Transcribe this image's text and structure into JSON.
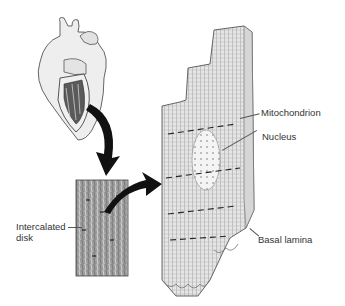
{
  "diagram": {
    "colors": {
      "background": "#ffffff",
      "ink": "#222222",
      "shade_light": "#d8d8d8",
      "shade_mid": "#a8a8a8",
      "shade_dark": "#555555",
      "label_text": "#333333"
    },
    "nodes": [
      {
        "id": "heart",
        "desc": "Heart illustration with cut-away ventricle wall"
      },
      {
        "id": "tissue-section",
        "desc": "Rectangular histology section of cardiac muscle"
      },
      {
        "id": "fiber-block",
        "desc": "3D block of cardiac muscle fibers with nucleus"
      }
    ],
    "arrows": [
      {
        "from": "heart",
        "to": "tissue-section"
      },
      {
        "from": "tissue-section",
        "to": "fiber-block"
      }
    ],
    "labels": {
      "mitochondrion": "Mitochondrion",
      "nucleus": "Nucleus",
      "intercalated_line1": "Intercalated",
      "intercalated_line2": "disk",
      "basal_lamina": "Basal lamina"
    }
  }
}
